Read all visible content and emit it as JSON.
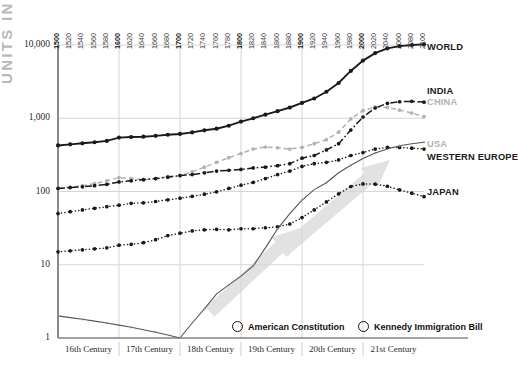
{
  "axis": {
    "ylabel": "UNITS IN MILLIONS",
    "yticks": [
      "10,000",
      "1,000",
      "100",
      "10",
      "1"
    ],
    "years": [
      "1500",
      "1520",
      "1540",
      "1560",
      "1580",
      "1600",
      "1620",
      "1640",
      "1660",
      "1680",
      "1700",
      "1720",
      "1740",
      "1760",
      "1780",
      "1800",
      "1820",
      "1840",
      "1860",
      "1880",
      "1900",
      "1920",
      "1940",
      "1960",
      "1980",
      "2000",
      "2020",
      "2040",
      "2060",
      "2080",
      "2100"
    ],
    "bold_years": [
      "1500",
      "1600",
      "1700",
      "1800",
      "1900",
      "2000"
    ],
    "centuries": [
      "16th Century",
      "17th Century",
      "18th Century",
      "19th Century",
      "20th Century",
      "21st Century"
    ]
  },
  "series_labels": {
    "world": "WORLD",
    "india": "INDIA",
    "china": "CHINA",
    "usa": "USA",
    "western_europe": "WESTERN EUROPE",
    "japan": "JAPAN"
  },
  "legend": [
    {
      "label": "American Constitution",
      "marker": "open-circle"
    },
    {
      "label": "Kennedy Immigration Bill",
      "marker": "open-circle"
    }
  ],
  "colors": {
    "ink": "#1a1a1a",
    "gray": "#b2b2b2",
    "grid": "#d6d6d6",
    "arrow": "#e2e2e2",
    "axis": "#8a8a8a"
  },
  "chart_data": {
    "type": "line",
    "title": "",
    "xlabel": "",
    "ylabel": "UNITS IN MILLIONS",
    "yscale": "log",
    "ylim": [
      1,
      10000
    ],
    "xlim": [
      1500,
      2100
    ],
    "grid": true,
    "legend_position": "right",
    "x": [
      1500,
      1520,
      1540,
      1560,
      1580,
      1600,
      1620,
      1640,
      1660,
      1680,
      1700,
      1720,
      1740,
      1760,
      1780,
      1800,
      1820,
      1840,
      1860,
      1880,
      1900,
      1920,
      1940,
      1960,
      1980,
      2000,
      2020,
      2040,
      2060,
      2080,
      2100
    ],
    "series": [
      {
        "name": "WORLD",
        "style": "solid",
        "color": "#1a1a1a",
        "values": [
          425,
          440,
          455,
          470,
          490,
          545,
          555,
          560,
          575,
          595,
          610,
          640,
          685,
          720,
          790,
          900,
          1000,
          1120,
          1250,
          1400,
          1620,
          1860,
          2300,
          3030,
          4430,
          6120,
          7750,
          9000,
          9650,
          10000,
          10200
        ]
      },
      {
        "name": "CHINA",
        "style": "dashed",
        "color": "#b2b2b2",
        "values": [
          110,
          115,
          120,
          128,
          140,
          155,
          150,
          145,
          150,
          160,
          165,
          185,
          215,
          250,
          290,
          330,
          380,
          405,
          395,
          380,
          400,
          450,
          510,
          645,
          980,
          1270,
          1430,
          1400,
          1290,
          1180,
          1050
        ]
      },
      {
        "name": "INDIA",
        "style": "dashdot",
        "color": "#1a1a1a",
        "values": [
          110,
          113,
          116,
          120,
          125,
          135,
          140,
          145,
          150,
          157,
          165,
          170,
          180,
          190,
          195,
          200,
          210,
          215,
          225,
          240,
          285,
          310,
          370,
          450,
          690,
          1040,
          1380,
          1600,
          1680,
          1700,
          1660
        ]
      },
      {
        "name": "WESTERN EUROPE",
        "style": "dotted",
        "color": "#1a1a1a",
        "values": [
          50,
          53,
          56,
          59,
          62,
          65,
          69,
          70,
          73,
          77,
          81,
          86,
          92,
          99,
          110,
          122,
          133,
          150,
          170,
          190,
          220,
          240,
          250,
          270,
          310,
          340,
          380,
          400,
          400,
          390,
          380
        ]
      },
      {
        "name": "JAPAN",
        "style": "dotted",
        "color": "#1a1a1a",
        "values": [
          15,
          15.5,
          16,
          16.5,
          17,
          18.5,
          19,
          20,
          22,
          25,
          27,
          29,
          30,
          30.5,
          30,
          31,
          31,
          32,
          33,
          36,
          44,
          56,
          72,
          93,
          117,
          127,
          126,
          118,
          105,
          95,
          85
        ]
      },
      {
        "name": "USA",
        "style": "solid-thin",
        "color": "#555555",
        "values": [
          2,
          1.9,
          1.8,
          1.7,
          1.6,
          1.5,
          1.4,
          1.3,
          1.2,
          1.1,
          1.0,
          1.6,
          2.5,
          4,
          5.3,
          7,
          9.6,
          17,
          31,
          50,
          76,
          106,
          132,
          180,
          228,
          282,
          335,
          380,
          420,
          450,
          470
        ]
      }
    ],
    "annotations": [
      {
        "text": "American Constitution",
        "marker": "open-circle",
        "x": 1787
      },
      {
        "text": "Kennedy Immigration Bill",
        "marker": "open-circle",
        "x": 1965
      }
    ]
  }
}
